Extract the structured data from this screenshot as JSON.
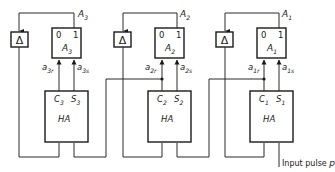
{
  "diagram": {
    "title": "",
    "stages": [
      {
        "index": 3,
        "delay": {
          "symbol": "Δ"
        },
        "flipflop": {
          "name": "A",
          "sub": "3",
          "state0": "0",
          "state1": "1",
          "output_label": "A",
          "output_sub": "3"
        },
        "inputs": {
          "reset": {
            "base": "a",
            "sub": "3r"
          },
          "set": {
            "base": "a",
            "sub": "3s"
          }
        },
        "half_adder": {
          "label": "HA",
          "carry": "C",
          "carry_sub": "3",
          "sum": "S",
          "sum_sub": "3"
        }
      },
      {
        "index": 2,
        "delay": {
          "symbol": "Δ"
        },
        "flipflop": {
          "name": "A",
          "sub": "2",
          "state0": "0",
          "state1": "1",
          "output_label": "A",
          "output_sub": "2"
        },
        "inputs": {
          "reset": {
            "base": "a",
            "sub": "2r"
          },
          "set": {
            "base": "a",
            "sub": "2s"
          }
        },
        "half_adder": {
          "label": "HA",
          "carry": "C",
          "carry_sub": "2",
          "sum": "S",
          "sum_sub": "2"
        }
      },
      {
        "index": 1,
        "delay": {
          "symbol": "Δ"
        },
        "flipflop": {
          "name": "A",
          "sub": "1",
          "state0": "0",
          "state1": "1",
          "output_label": "A",
          "output_sub": "1"
        },
        "inputs": {
          "reset": {
            "base": "a",
            "sub": "1r"
          },
          "set": {
            "base": "a",
            "sub": "1s"
          }
        },
        "half_adder": {
          "label": "HA",
          "carry": "C",
          "carry_sub": "1",
          "sum": "S",
          "sum_sub": "1"
        }
      }
    ],
    "input_label": "Input pulse",
    "input_symbol": "p"
  }
}
